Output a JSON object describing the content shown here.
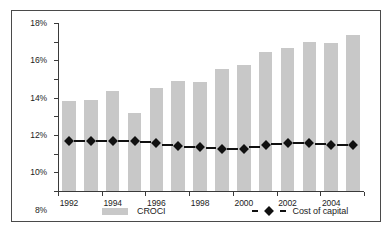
{
  "chart_data": {
    "type": "bar",
    "title": "",
    "subtitle": "",
    "xlabel": "",
    "ylabel": "",
    "ylim": [
      0,
      18
    ],
    "ytick_labels": [
      "0%",
      "2%",
      "4%",
      "6%",
      "8%",
      "10%",
      "12%",
      "14%",
      "16%",
      "18%"
    ],
    "ytick_values": [
      0,
      2,
      4,
      6,
      8,
      10,
      12,
      14,
      16,
      18
    ],
    "grid": false,
    "legend_position": "bottom",
    "categories": [
      "1992",
      "1993",
      "1994",
      "1995",
      "1996",
      "1997",
      "1998",
      "1999",
      "2000",
      "2001",
      "2002",
      "2003",
      "2004",
      "2005"
    ],
    "xtick_labels": [
      "1992",
      "1994",
      "1996",
      "1998",
      "2000",
      "2002",
      "2004"
    ],
    "xtick_categories": [
      "1992",
      "1994",
      "1996",
      "1998",
      "2000",
      "2002",
      "2004"
    ],
    "series": [
      {
        "name": "CROCI",
        "type": "bar",
        "color": "#c8c8c8",
        "values": [
          9.6,
          9.8,
          10.7,
          8.4,
          11.0,
          11.8,
          11.7,
          13.1,
          13.5,
          14.9,
          15.3,
          16.0,
          15.9,
          16.7
        ]
      },
      {
        "name": "Cost of capital",
        "type": "line",
        "color": "#111111",
        "line_style": "dashed",
        "marker": "diamond",
        "values": [
          5.4,
          5.4,
          5.4,
          5.35,
          5.1,
          4.8,
          4.7,
          4.5,
          4.5,
          4.9,
          5.1,
          5.15,
          4.95,
          4.95
        ]
      }
    ]
  },
  "legend": {
    "croci_label": "CROCI",
    "cost_of_capital_label": "Cost of capital"
  }
}
